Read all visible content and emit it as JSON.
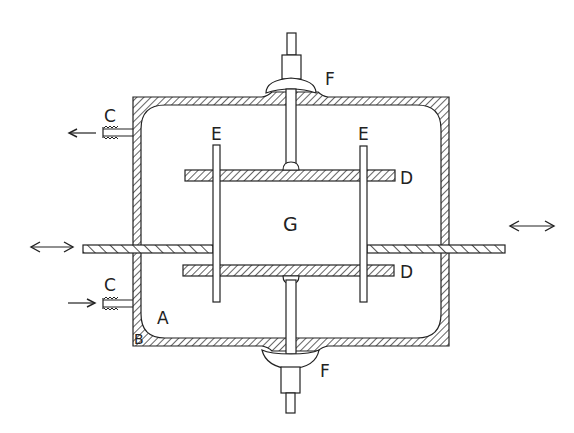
{
  "diagram": {
    "type": "cross-section schematic",
    "stroke_color": "#222222",
    "background": "#ffffff",
    "labels": {
      "A": "A",
      "B": "B",
      "C_top": "C",
      "C_bottom": "C",
      "D_top": "D",
      "D_bottom": "D",
      "E_left": "E",
      "E_right": "E",
      "F_top": "F",
      "F_bottom": "F",
      "G": "G"
    },
    "components": [
      {
        "id": "A",
        "role": "chamber interior (enclosure space)"
      },
      {
        "id": "B",
        "role": "chamber wall (hatched outer housing)"
      },
      {
        "id": "C",
        "role": "ports / hose fittings, top outlet and bottom inlet"
      },
      {
        "id": "D",
        "role": "pair of horizontal hatched plates"
      },
      {
        "id": "E",
        "role": "pair of vertical rods passing through plates"
      },
      {
        "id": "F",
        "role": "top and bottom cap / seal fittings with shafts"
      },
      {
        "id": "G",
        "role": "central gap between the plates"
      }
    ],
    "arrows": [
      {
        "id": "arrow-outlet",
        "direction": "left",
        "at": "C top"
      },
      {
        "id": "arrow-inlet",
        "direction": "right",
        "at": "C bottom"
      },
      {
        "id": "arrow-left-rod",
        "direction": "bidirectional",
        "at": "left rod end"
      },
      {
        "id": "arrow-right-rod",
        "direction": "bidirectional",
        "at": "right rod end"
      }
    ]
  }
}
